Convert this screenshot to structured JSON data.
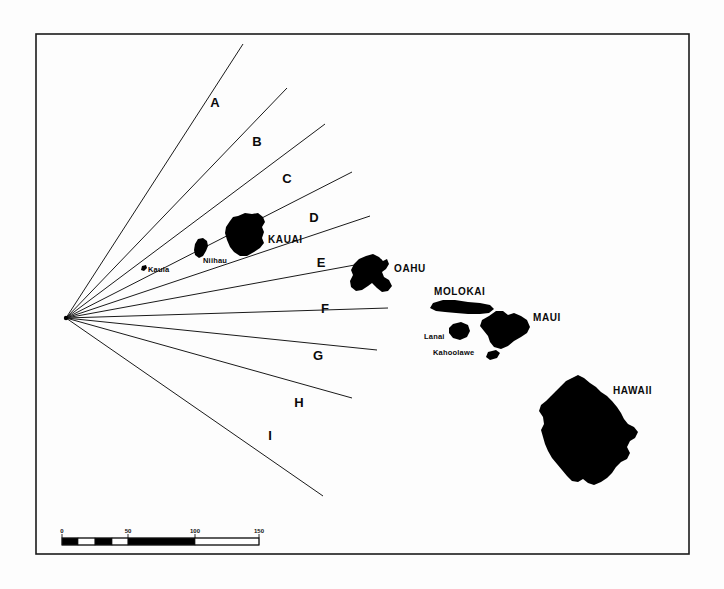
{
  "map": {
    "title": "Hawaiian Islands with radial sector lines",
    "background_color": "#fdfdfd",
    "ink_color": "#000000",
    "frame": {
      "x": 36,
      "y": 34,
      "width": 653,
      "height": 520
    }
  },
  "origin": {
    "label": "radial-origin",
    "x": 66,
    "y": 318
  },
  "sectors": [
    {
      "letter": "A",
      "label_x": 215,
      "label_y": 107
    },
    {
      "letter": "B",
      "label_x": 257,
      "label_y": 146
    },
    {
      "letter": "C",
      "label_x": 287,
      "label_y": 183
    },
    {
      "letter": "D",
      "label_x": 314,
      "label_y": 222
    },
    {
      "letter": "E",
      "label_x": 321,
      "label_y": 267
    },
    {
      "letter": "F",
      "label_x": 325,
      "label_y": 313
    },
    {
      "letter": "G",
      "label_x": 318,
      "label_y": 360
    },
    {
      "letter": "H",
      "label_x": 299,
      "label_y": 407
    },
    {
      "letter": "I",
      "label_x": 270,
      "label_y": 440
    }
  ],
  "radial_lines": [
    {
      "id": "line-1",
      "x2": 243,
      "y2": 44
    },
    {
      "id": "line-2",
      "x2": 287,
      "y2": 88
    },
    {
      "id": "line-3",
      "x2": 325,
      "y2": 124
    },
    {
      "id": "line-4",
      "x2": 352,
      "y2": 172
    },
    {
      "id": "line-5",
      "x2": 370,
      "y2": 216
    },
    {
      "id": "line-6",
      "x2": 382,
      "y2": 260
    },
    {
      "id": "line-7",
      "x2": 388,
      "y2": 308
    },
    {
      "id": "line-8",
      "x2": 377,
      "y2": 350
    },
    {
      "id": "line-9",
      "x2": 352,
      "y2": 398
    },
    {
      "id": "line-10",
      "x2": 323,
      "y2": 496
    }
  ],
  "islands": [
    {
      "name": "KAUAI",
      "label_x": 268,
      "label_y": 243,
      "label_style": "major"
    },
    {
      "name": "Niihau",
      "label_x": 203,
      "label_y": 263,
      "label_style": "minor"
    },
    {
      "name": "Kaula",
      "label_x": 148,
      "label_y": 272,
      "label_style": "minor"
    },
    {
      "name": "OAHU",
      "label_x": 394,
      "label_y": 272,
      "label_style": "major"
    },
    {
      "name": "MOLOKAI",
      "label_x": 434,
      "label_y": 295,
      "label_style": "major"
    },
    {
      "name": "MAUI",
      "label_x": 533,
      "label_y": 321,
      "label_style": "major"
    },
    {
      "name": "Lanai",
      "label_x": 424,
      "label_y": 339,
      "label_style": "minor"
    },
    {
      "name": "Kahoolawe",
      "label_x": 433,
      "label_y": 355,
      "label_style": "minor"
    },
    {
      "name": "HAWAII",
      "label_x": 613,
      "label_y": 394,
      "label_style": "major"
    }
  ],
  "scale_bar": {
    "x": 62,
    "y": 538,
    "width": 197,
    "height": 7,
    "unit_ticks": [
      "0",
      "50",
      "100",
      "150"
    ],
    "tick_positions_px": [
      62,
      128,
      195,
      259
    ],
    "segments": [
      {
        "from": 62,
        "to": 78,
        "filled": true
      },
      {
        "from": 78,
        "to": 95,
        "filled": false
      },
      {
        "from": 95,
        "to": 112,
        "filled": true
      },
      {
        "from": 112,
        "to": 128,
        "filled": false
      },
      {
        "from": 128,
        "to": 195,
        "filled": true
      },
      {
        "from": 195,
        "to": 259,
        "filled": false
      }
    ]
  }
}
